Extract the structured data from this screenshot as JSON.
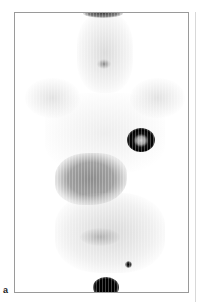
{
  "figure": {
    "panel_label": "a",
    "image_type": "PET maximum intensity projection, anterior view",
    "background_color": "#ffffff",
    "uptake_color": "#000000"
  }
}
